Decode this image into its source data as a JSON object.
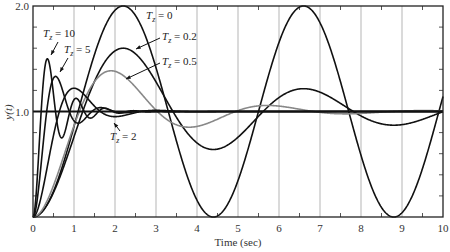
{
  "chart_data": {
    "type": "line",
    "title": "",
    "xlabel": "Time (sec)",
    "ylabel": "y(t)",
    "xlim": [
      0,
      10
    ],
    "ylim": [
      0,
      2.0
    ],
    "x_ticks": [
      0,
      1,
      2,
      3,
      4,
      5,
      6,
      7,
      8,
      9,
      10
    ],
    "x_tick_labels": [
      "0",
      "1",
      "2",
      "3",
      "4",
      "5",
      "6",
      "7",
      "8",
      "9",
      "10"
    ],
    "y_tick_labels": [
      {
        "value": 2.0,
        "label": "2.0"
      },
      {
        "value": 1.0,
        "label": "1.0"
      },
      {
        "value": 0,
        "label": ""
      }
    ],
    "y_minor_ticks": [
      0.2,
      0.4,
      0.6,
      0.8,
      1.2,
      1.4,
      1.6,
      1.8
    ],
    "x_minor_ticks": [
      0.5,
      1.5,
      2.5,
      3.5,
      4.5,
      5.5,
      6.5,
      7.5,
      8.5,
      9.5
    ],
    "grid": {
      "vertical": true,
      "horizontal": false
    },
    "reference_line": {
      "y": 1.0,
      "color": "#111111"
    },
    "legend": "none (inline annotations with arrows)",
    "series": [
      {
        "name": "T_z = 0",
        "color": "#111111",
        "sigma": 0.0,
        "omega": 1.428,
        "key_points": [
          [
            0,
            0
          ],
          [
            2.2,
            2.0
          ],
          [
            4.4,
            0.0
          ],
          [
            6.6,
            2.0
          ],
          [
            8.8,
            0.0
          ],
          [
            10,
            0.95
          ]
        ]
      },
      {
        "name": "T_z = 0.2",
        "color": "#111111",
        "sigma": 0.232,
        "omega": 1.428,
        "key_points": [
          [
            0,
            0
          ],
          [
            2.2,
            1.6
          ],
          [
            4.4,
            0.6
          ],
          [
            6.6,
            1.25
          ],
          [
            8.8,
            0.78
          ],
          [
            10,
            1.08
          ]
        ]
      },
      {
        "name": "T_z = 0.5",
        "color": "#888888",
        "sigma": 0.5,
        "omega": 1.65,
        "key_points": [
          [
            0,
            0
          ],
          [
            1.9,
            1.37
          ],
          [
            3.8,
            0.82
          ],
          [
            5.7,
            1.05
          ],
          [
            7.6,
            0.98
          ],
          [
            10,
            1.0
          ]
        ]
      },
      {
        "name": "T_z = 2",
        "color": "#111111",
        "sigma": 1.51,
        "omega": 3.14,
        "key_points": [
          [
            0,
            0
          ],
          [
            1.0,
            1.22
          ],
          [
            2.0,
            0.94
          ],
          [
            3.0,
            1.01
          ],
          [
            10,
            1.0
          ]
        ]
      },
      {
        "name": "T_z = 5",
        "color": "#111111",
        "sigma": 2.0,
        "omega": 5.71,
        "key_points": [
          [
            0,
            0
          ],
          [
            0.55,
            1.33
          ],
          [
            1.1,
            0.89
          ],
          [
            1.65,
            1.04
          ],
          [
            10,
            1.0
          ]
        ]
      },
      {
        "name": "T_z = 10",
        "color": "#111111",
        "sigma": 1.98,
        "omega": 8.98,
        "key_points": [
          [
            0,
            0
          ],
          [
            0.35,
            1.5
          ],
          [
            0.7,
            0.75
          ],
          [
            1.05,
            1.12
          ],
          [
            1.4,
            0.94
          ],
          [
            10,
            1.0
          ]
        ]
      }
    ],
    "annotations": [
      {
        "text": "T",
        "sub": "z",
        "rest": " = 10",
        "x": 43,
        "y": 37,
        "arrow": [
          [
            58,
            42
          ],
          [
            51,
            55
          ]
        ]
      },
      {
        "text": "T",
        "sub": "z",
        "rest": " = 5",
        "x": 64,
        "y": 53,
        "arrow": [
          [
            68,
            58
          ],
          [
            60,
            72
          ]
        ]
      },
      {
        "text": "T",
        "sub": "z",
        "rest": " = 0",
        "x": 146,
        "y": 19,
        "arrow": null
      },
      {
        "text": "T",
        "sub": "z",
        "rest": " = 0.2",
        "x": 162,
        "y": 40,
        "arrow": [
          [
            160,
            38
          ],
          [
            136,
            49
          ]
        ]
      },
      {
        "text": "T",
        "sub": "z",
        "rest": " = 0.5",
        "x": 162,
        "y": 65,
        "arrow": [
          [
            160,
            63
          ],
          [
            126,
            79
          ]
        ]
      },
      {
        "text": "T",
        "sub": "z",
        "rest": " = 2",
        "x": 110,
        "y": 140,
        "arrow": [
          [
            120,
            131
          ],
          [
            114,
            123
          ]
        ]
      }
    ]
  },
  "layout": {
    "plot_left": 33,
    "plot_right": 443,
    "plot_top": 6,
    "plot_bottom": 217
  }
}
